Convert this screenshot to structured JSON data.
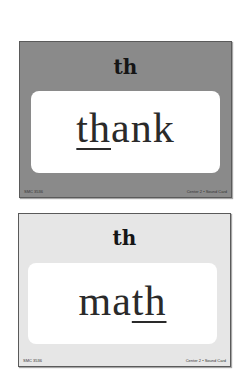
{
  "cards": [
    {
      "style": "dark",
      "background": "#8a8a8a",
      "sound": "th",
      "word_prefix": "",
      "word_underlined": "th",
      "word_suffix": "ank",
      "full_word": "thank",
      "footer_left": "SMC 3536",
      "footer_right": "Center 2 • Sound Card"
    },
    {
      "style": "light",
      "background": "#e6e6e6",
      "sound": "th",
      "word_prefix": "ma",
      "word_underlined": "th",
      "word_suffix": "",
      "full_word": "math",
      "footer_left": "SMC 3536",
      "footer_right": "Center 2 • Sound Card"
    }
  ]
}
